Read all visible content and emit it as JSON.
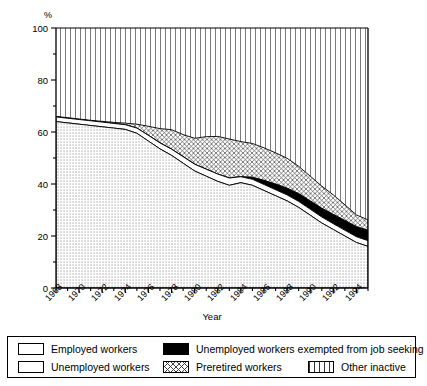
{
  "chart_data": {
    "type": "area",
    "title": "",
    "subtitle": "",
    "xlabel": "Year",
    "ylabel": "%",
    "ylabel_position": "top-left",
    "xlim": [
      1968,
      1995
    ],
    "ylim": [
      0,
      100
    ],
    "grid": false,
    "stacked": true,
    "legend_position": "bottom",
    "y_ticks_major": [
      0,
      20,
      40,
      60,
      80,
      100
    ],
    "y_ticks_minor": [
      10,
      30,
      50,
      70,
      90
    ],
    "x_ticks_labeled": [
      1968,
      1970,
      1972,
      1974,
      1976,
      1978,
      1980,
      1982,
      1984,
      1986,
      1988,
      1990,
      1992,
      1994
    ],
    "x_ticks_all": [
      1968,
      1969,
      1970,
      1971,
      1972,
      1973,
      1974,
      1975,
      1976,
      1977,
      1978,
      1979,
      1980,
      1981,
      1982,
      1983,
      1984,
      1985,
      1986,
      1987,
      1988,
      1989,
      1990,
      1991,
      1992,
      1993,
      1994,
      1995
    ],
    "x": [
      1968,
      1969,
      1970,
      1971,
      1972,
      1973,
      1974,
      1975,
      1976,
      1977,
      1978,
      1979,
      1980,
      1981,
      1982,
      1983,
      1984,
      1985,
      1986,
      1987,
      1988,
      1989,
      1990,
      1991,
      1992,
      1993,
      1994,
      1995
    ],
    "series": [
      {
        "name": "Employed workers",
        "pattern": "dotted",
        "fill": "#ffffff",
        "values": [
          64.0,
          63.5,
          63.0,
          62.5,
          62.0,
          61.5,
          61.0,
          59.5,
          56.5,
          53.5,
          51.0,
          48.0,
          45.0,
          43.0,
          41.0,
          39.5,
          40.5,
          39.5,
          37.5,
          35.5,
          33.5,
          31.0,
          28.0,
          25.0,
          22.5,
          20.0,
          17.5,
          16.0
        ]
      },
      {
        "name": "Unemployed workers",
        "pattern": "solid-white",
        "fill": "#ffffff",
        "values": [
          1.8,
          1.8,
          1.8,
          1.8,
          1.8,
          1.8,
          1.8,
          2.0,
          2.2,
          2.3,
          2.4,
          2.5,
          2.6,
          2.7,
          2.8,
          2.8,
          2.3,
          2.3,
          2.3,
          2.3,
          2.3,
          2.3,
          2.3,
          2.3,
          2.2,
          2.2,
          2.2,
          2.2
        ]
      },
      {
        "name": "Unemployed workers exempted from job seeking",
        "pattern": "solid-black",
        "fill": "#000000",
        "values": [
          0.0,
          0.0,
          0.0,
          0.0,
          0.0,
          0.0,
          0.0,
          0.0,
          0.0,
          0.0,
          0.0,
          0.0,
          0.0,
          0.0,
          0.0,
          0.0,
          0.0,
          0.8,
          1.6,
          2.2,
          2.6,
          3.0,
          3.2,
          3.4,
          3.6,
          3.8,
          3.9,
          4.0
        ]
      },
      {
        "name": "Preretired workers",
        "pattern": "crosshatch",
        "fill": "#ffffff",
        "values": [
          0.2,
          0.2,
          0.2,
          0.2,
          0.3,
          0.4,
          0.6,
          1.5,
          3.5,
          5.5,
          7.5,
          8.5,
          10.0,
          12.5,
          14.5,
          15.0,
          13.5,
          13.0,
          12.5,
          12.0,
          11.5,
          10.5,
          9.5,
          8.5,
          7.5,
          6.0,
          4.5,
          4.0
        ]
      },
      {
        "name": "Other inactive",
        "pattern": "vertical-lines",
        "fill": "#ffffff",
        "values": [
          34.0,
          34.5,
          35.0,
          35.5,
          35.9,
          36.3,
          36.6,
          37.0,
          37.8,
          38.7,
          39.1,
          40.5,
          42.4,
          41.8,
          41.7,
          42.7,
          43.7,
          44.4,
          46.1,
          48.0,
          50.1,
          53.2,
          57.0,
          60.8,
          64.2,
          68.0,
          71.9,
          73.8
        ]
      }
    ]
  },
  "legend": {
    "items": [
      {
        "label": "Employed workers",
        "swatch": "dotted"
      },
      {
        "label": "Unemployed workers exempted from job seeking",
        "swatch": "solid-black"
      },
      {
        "label": "Unemployed workers",
        "swatch": "solid-white"
      },
      {
        "label": "Preretired workers",
        "swatch": "crosshatch"
      },
      {
        "label": "Other inactive",
        "swatch": "vertical-lines"
      }
    ]
  },
  "axes": {
    "y_unit": "%",
    "x_title": "Year",
    "y_tick_labels": [
      "100",
      "80",
      "60",
      "40",
      "20",
      "0"
    ],
    "x_tick_labels": [
      "1968",
      "1970",
      "1972",
      "1974",
      "1976",
      "1978",
      "1980",
      "1982",
      "1984",
      "1986",
      "1988",
      "1990",
      "1992",
      "1994"
    ]
  }
}
